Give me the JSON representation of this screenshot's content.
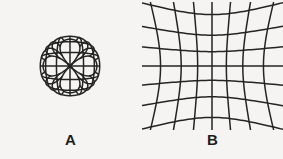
{
  "figure": {
    "background_color": "#f5f4f2",
    "line_color": "#242424",
    "caption_color": "#1d1d1d",
    "panel_count": 2,
    "panels": [
      {
        "id": "a",
        "caption": "A",
        "distortion_type": "pincushion",
        "description": "Square grid with pincushion distortion: lines bow inward toward the centre and flare outward at the corners.",
        "grid_lines_horizontal": 9,
        "grid_lines_vertical": 9,
        "line_width": 1.5,
        "distortion_strength": -0.52,
        "grid_half_size": 44,
        "center_x": 70,
        "center_y": 64,
        "extent": 56
      },
      {
        "id": "b",
        "caption": "B",
        "distortion_type": "barrel",
        "description": "Square grid with barrel distortion: lines bulge outward from the centre giving a rounded, globe-like outline.",
        "grid_lines_horizontal": 9,
        "grid_lines_vertical": 9,
        "line_width": 1.5,
        "distortion_strength": 0.4,
        "grid_half_size": 44,
        "center_x": 70,
        "center_y": 64,
        "extent": 56
      }
    ]
  }
}
